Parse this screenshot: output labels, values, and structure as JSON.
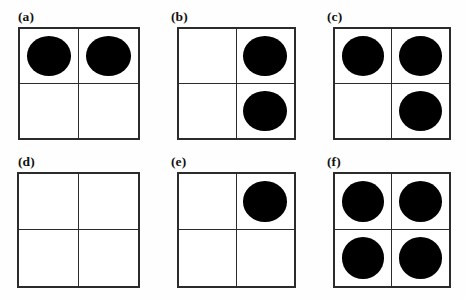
{
  "figure": {
    "title": "",
    "background_color": "#fefefe",
    "grid_line_color": "#2b2b2b",
    "dot_color": "#000000",
    "columns": 3,
    "rows": 2
  },
  "panels": [
    {
      "id": "panel-a",
      "label": "(a)",
      "label_x": 18,
      "label_y": 10,
      "grid_x": 18,
      "grid_y": 27,
      "grid_w": 122,
      "grid_h": 113,
      "dot_count": 2,
      "cells": [
        {
          "name": "top-left",
          "filled": true
        },
        {
          "name": "top-right",
          "filled": true
        },
        {
          "name": "bottom-left",
          "filled": false
        },
        {
          "name": "bottom-right",
          "filled": false
        }
      ]
    },
    {
      "id": "panel-b",
      "label": "(b)",
      "label_x": 171,
      "label_y": 10,
      "grid_x": 177,
      "grid_y": 27,
      "grid_w": 119,
      "grid_h": 113,
      "dot_count": 2,
      "cells": [
        {
          "name": "top-left",
          "filled": false
        },
        {
          "name": "top-right",
          "filled": true
        },
        {
          "name": "bottom-left",
          "filled": false
        },
        {
          "name": "bottom-right",
          "filled": true
        }
      ]
    },
    {
      "id": "panel-c",
      "label": "(c)",
      "label_x": 327,
      "label_y": 10,
      "grid_x": 333,
      "grid_y": 27,
      "grid_w": 118,
      "grid_h": 113,
      "dot_count": 3,
      "cells": [
        {
          "name": "top-left",
          "filled": true
        },
        {
          "name": "top-right",
          "filled": true
        },
        {
          "name": "bottom-left",
          "filled": false
        },
        {
          "name": "bottom-right",
          "filled": true
        }
      ]
    },
    {
      "id": "panel-d",
      "label": "(d)",
      "label_x": 18,
      "label_y": 155,
      "grid_x": 17,
      "grid_y": 172,
      "grid_w": 123,
      "grid_h": 116,
      "dot_count": 0,
      "cells": [
        {
          "name": "top-left",
          "filled": false
        },
        {
          "name": "top-right",
          "filled": false
        },
        {
          "name": "bottom-left",
          "filled": false
        },
        {
          "name": "bottom-right",
          "filled": false
        }
      ]
    },
    {
      "id": "panel-e",
      "label": "(e)",
      "label_x": 171,
      "label_y": 155,
      "grid_x": 177,
      "grid_y": 172,
      "grid_w": 119,
      "grid_h": 116,
      "dot_count": 1,
      "cells": [
        {
          "name": "top-left",
          "filled": false
        },
        {
          "name": "top-right",
          "filled": true
        },
        {
          "name": "bottom-left",
          "filled": false
        },
        {
          "name": "bottom-right",
          "filled": false
        }
      ]
    },
    {
      "id": "panel-f",
      "label": "(f)",
      "label_x": 327,
      "label_y": 155,
      "grid_x": 333,
      "grid_y": 172,
      "grid_w": 118,
      "grid_h": 116,
      "dot_count": 4,
      "cells": [
        {
          "name": "top-left",
          "filled": true
        },
        {
          "name": "top-right",
          "filled": true
        },
        {
          "name": "bottom-left",
          "filled": true
        },
        {
          "name": "bottom-right",
          "filled": true
        }
      ]
    }
  ]
}
